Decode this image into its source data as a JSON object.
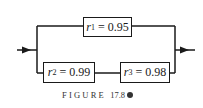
{
  "diagram": {
    "type": "reliability-block-diagram",
    "components": [
      {
        "id": "r1",
        "symbol": "r",
        "subscript": "1",
        "value": "0.95",
        "path": "top-parallel-branch"
      },
      {
        "id": "r2",
        "symbol": "r",
        "subscript": "2",
        "value": "0.99",
        "path": "bottom-series-branch"
      },
      {
        "id": "r3",
        "symbol": "r",
        "subscript": "3",
        "value": "0.98",
        "path": "bottom-series-branch"
      }
    ],
    "equals": "=",
    "caption": {
      "word": "FIGURE",
      "number": "17.8"
    },
    "colors": {
      "line": "#1a1a1a",
      "background": "#ffffff"
    }
  }
}
